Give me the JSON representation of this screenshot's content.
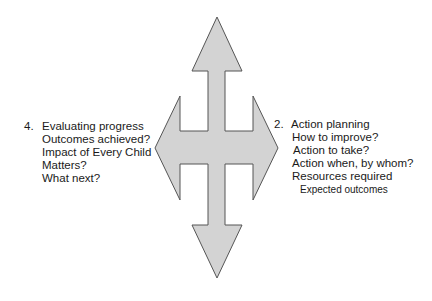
{
  "diagram": {
    "type": "four-way-arrow",
    "colors": {
      "arrow_fill": "#d3d3d3",
      "arrow_stroke": "#555555",
      "background": "#ffffff",
      "text": "#1a1a1a"
    },
    "left_panel": {
      "number": "4.",
      "title": "Evaluating progress",
      "lines": [
        "Outcomes achieved?",
        "Impact of Every Child",
        "Matters?",
        "What next?"
      ]
    },
    "right_panel": {
      "number": "2.",
      "title": "Action planning",
      "lines": [
        "How to improve?",
        "Action to take?",
        "Action when, by whom?",
        "Resources required",
        "Expected outcomes"
      ]
    }
  }
}
